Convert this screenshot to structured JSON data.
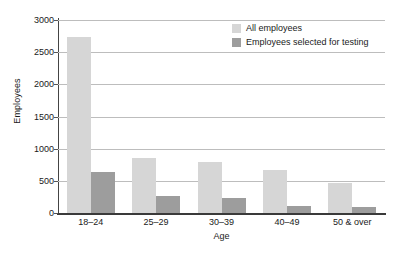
{
  "chart_data": {
    "type": "bar",
    "title": "",
    "xlabel": "Age",
    "ylabel": "Employees",
    "categories": [
      "18–24",
      "25–29",
      "30–39",
      "40–49",
      "50 & over"
    ],
    "series": [
      {
        "name": "All employees",
        "color": "#d6d6d6",
        "values": [
          2730,
          860,
          790,
          670,
          470
        ]
      },
      {
        "name": "Employees selected for testing",
        "color": "#9d9d9d",
        "values": [
          645,
          265,
          240,
          110,
          95
        ]
      }
    ],
    "ylim": [
      0,
      3000
    ],
    "y_ticks": [
      0,
      500,
      1000,
      1500,
      2000,
      2500,
      3000
    ],
    "y_tick_labels": [
      "0",
      "500",
      "1000",
      "1500",
      "2000",
      "2500",
      "3000"
    ],
    "grid": true,
    "legend_position": "top-right",
    "colors": {
      "light_bar": "#d6d6d6",
      "dark_bar": "#9d9d9d",
      "gridline": "#bdbdbd",
      "axis": "#3a3a3a",
      "background": "#ffffff"
    }
  }
}
